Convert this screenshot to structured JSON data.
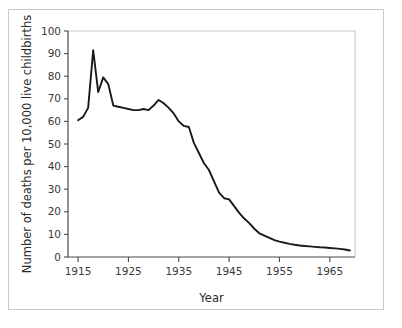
{
  "figure": {
    "background_color": "#ffffff",
    "frame_color": "#c9c9c9",
    "axis_color": "#4a4a4a",
    "line_color": "#1a1a1a"
  },
  "chart_data": {
    "type": "line",
    "title": "",
    "xlabel": "Year",
    "ylabel": "Number of deaths per 10,000 live childbirths",
    "xlim": [
      1913,
      1970
    ],
    "ylim": [
      0,
      100
    ],
    "xticks": [
      1915,
      1925,
      1935,
      1945,
      1955,
      1965
    ],
    "xtick_labels": [
      "1915",
      "1925",
      "1935",
      "1945",
      "1955",
      "1965"
    ],
    "yticks": [
      0,
      10,
      20,
      30,
      40,
      50,
      60,
      70,
      80,
      90,
      100
    ],
    "ytick_labels": [
      "0",
      "10",
      "20",
      "30",
      "40",
      "50",
      "60",
      "70",
      "80",
      "90",
      "100"
    ],
    "grid": false,
    "legend": false,
    "series": [
      {
        "name": "Maternal mortality rate",
        "x": [
          1915,
          1916,
          1917,
          1918,
          1919,
          1920,
          1921,
          1922,
          1923,
          1924,
          1925,
          1926,
          1927,
          1928,
          1929,
          1930,
          1931,
          1932,
          1933,
          1934,
          1935,
          1936,
          1937,
          1938,
          1939,
          1940,
          1941,
          1942,
          1943,
          1944,
          1945,
          1946,
          1947,
          1948,
          1949,
          1950,
          1951,
          1952,
          1953,
          1954,
          1955,
          1956,
          1957,
          1958,
          1959,
          1960,
          1961,
          1962,
          1963,
          1964,
          1965,
          1966,
          1967,
          1968,
          1969
        ],
        "values": [
          60.5,
          62.0,
          66.0,
          91.5,
          73.0,
          79.5,
          76.5,
          67.0,
          66.5,
          66.0,
          65.5,
          65.0,
          65.0,
          65.5,
          65.0,
          67.0,
          69.5,
          68.0,
          66.0,
          63.5,
          60.0,
          58.0,
          57.5,
          50.5,
          46.0,
          41.5,
          38.5,
          33.5,
          28.5,
          26.0,
          25.5,
          22.5,
          19.5,
          17.0,
          15.0,
          12.5,
          10.5,
          9.5,
          8.5,
          7.5,
          6.8,
          6.3,
          5.8,
          5.4,
          5.1,
          4.9,
          4.7,
          4.5,
          4.3,
          4.2,
          4.0,
          3.8,
          3.6,
          3.3,
          2.9
        ]
      }
    ]
  }
}
